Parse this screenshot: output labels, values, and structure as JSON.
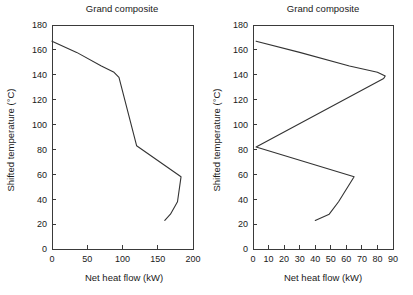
{
  "figure": {
    "background": "#ffffff",
    "line_color": "#333333",
    "axis_color": "#3a3a3a",
    "text_color": "#1a1a1a"
  },
  "chart_data": [
    {
      "type": "line",
      "id": "grand-composite-left",
      "title": "Grand composite",
      "xlabel": "Net heat flow (kW)",
      "ylabel": "Shifted temperature (°C)",
      "xlim": [
        0,
        200
      ],
      "ylim": [
        0,
        180
      ],
      "xticks": [
        0,
        50,
        100,
        150,
        200
      ],
      "yticks": [
        0,
        20,
        40,
        60,
        80,
        100,
        120,
        140,
        160,
        180
      ],
      "xtick_labels": [
        "0",
        "50",
        "100",
        "150",
        "200"
      ],
      "ytick_labels": [
        "0",
        "20",
        "40",
        "60",
        "80",
        "100",
        "120",
        "140",
        "160",
        "180"
      ],
      "grid": false,
      "legend": null,
      "series": [
        {
          "name": "Grand composite curve",
          "x": [
            0,
            35,
            70,
            88,
            95,
            120,
            183,
            178,
            168,
            160
          ],
          "y": [
            167,
            158,
            147,
            142,
            138,
            83,
            58,
            38,
            28,
            23
          ]
        }
      ]
    },
    {
      "type": "line",
      "id": "grand-composite-right",
      "title": "Grand composite",
      "xlabel": "Net heat flow (kW)",
      "ylabel": "Shifted temperature (°C)",
      "xlim": [
        0,
        90
      ],
      "ylim": [
        0,
        180
      ],
      "xticks": [
        0,
        10,
        20,
        30,
        40,
        50,
        60,
        70,
        80,
        90
      ],
      "yticks": [
        0,
        20,
        40,
        60,
        80,
        100,
        120,
        140,
        160,
        180
      ],
      "xtick_labels": [
        "0",
        "10",
        "20",
        "30",
        "40",
        "50",
        "60",
        "70",
        "80",
        "90"
      ],
      "ytick_labels": [
        "0",
        "20",
        "40",
        "60",
        "80",
        "100",
        "120",
        "140",
        "160",
        "180"
      ],
      "grid": false,
      "legend": null,
      "series": [
        {
          "name": "Grand composite curve",
          "x": [
            2,
            30,
            62,
            80,
            85,
            84,
            2,
            65,
            63,
            55,
            49,
            40
          ],
          "y": [
            167,
            158,
            147,
            142,
            139,
            137,
            82,
            58,
            54,
            38,
            28,
            23
          ]
        }
      ]
    }
  ],
  "panels": {
    "left": {
      "title": "Grand composite",
      "xlabel": "Net heat flow (kW)",
      "ylabel": "Shifted temperature (°C)"
    },
    "right": {
      "title": "Grand composite",
      "xlabel": "Net heat flow (kW)",
      "ylabel": "Shifted temperature (°C)"
    }
  }
}
